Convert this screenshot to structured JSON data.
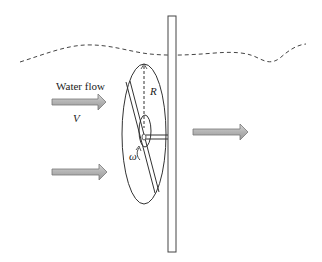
{
  "diagram": {
    "type": "water-turbine-schematic",
    "labels": {
      "flow_label": "Water flow",
      "velocity_symbol": "V",
      "radius_symbol": "R",
      "angular_velocity_symbol": "ω"
    },
    "elements": {
      "water_surface": "dashed wavy line",
      "support_pole": "vertical rectangle",
      "rotor_disk": "ellipse",
      "blade": "diagonal double-line blade",
      "hub": "small ellipse",
      "shaft": "horizontal double line to pole",
      "inflow_arrows": 2,
      "outflow_arrows": 1
    },
    "colors": {
      "line": "#333333",
      "arrow_fill": "#b8b8b8",
      "arrow_stroke": "#777777",
      "background": "#ffffff"
    }
  }
}
